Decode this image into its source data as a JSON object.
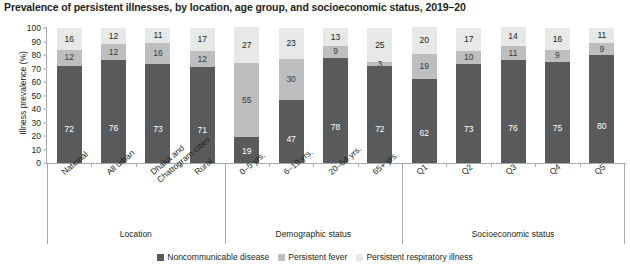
{
  "chart_data": {
    "type": "bar",
    "subtype": "stacked-bar-percent",
    "title": "Prevalence of persistent illnesses, by location, age group, and socioeconomic status, 2019–20",
    "xlabel": "",
    "ylabel": "Illness prevalence (%)",
    "ylim": [
      0,
      100
    ],
    "ytick_step": 10,
    "ytick_labels": [
      "0",
      "10",
      "20",
      "30",
      "40",
      "50",
      "60",
      "70",
      "80",
      "90",
      "100"
    ],
    "grid": false,
    "legend_position": "bottom-center",
    "categories": [
      "National",
      "All urban",
      "Dhaka and\nChattogram cities",
      "Rural",
      "0–5 yrs.",
      "6–19 yrs.",
      "20–64 yrs.",
      "65+ yrs.",
      "Q1",
      "Q2",
      "Q3",
      "Q4",
      "Q5"
    ],
    "series": [
      {
        "name": "Noncommunicable disease",
        "color": "#595a5c",
        "values": [
          72,
          76,
          73,
          71,
          19,
          47,
          78,
          72,
          62,
          73,
          76,
          75,
          80
        ]
      },
      {
        "name": "Persistent fever",
        "color": "#bcbec0",
        "values": [
          12,
          12,
          16,
          12,
          55,
          30,
          9,
          3,
          19,
          10,
          11,
          9,
          9
        ]
      },
      {
        "name": "Persistent respiratory illness",
        "color": "#e7e8e8",
        "values": [
          16,
          12,
          11,
          17,
          27,
          23,
          13,
          25,
          20,
          17,
          14,
          16,
          11
        ]
      }
    ],
    "groups": [
      {
        "label": "Location",
        "categories": [
          "National",
          "All urban",
          "Dhaka and Chattogram cities",
          "Rural"
        ]
      },
      {
        "label": "Demographic status",
        "categories": [
          "0–5 yrs.",
          "6–19 yrs.",
          "20–64 yrs.",
          "65+ yrs."
        ]
      },
      {
        "label": "Socioeconomic status",
        "categories": [
          "Q1",
          "Q2",
          "Q3",
          "Q4",
          "Q5"
        ]
      }
    ]
  }
}
